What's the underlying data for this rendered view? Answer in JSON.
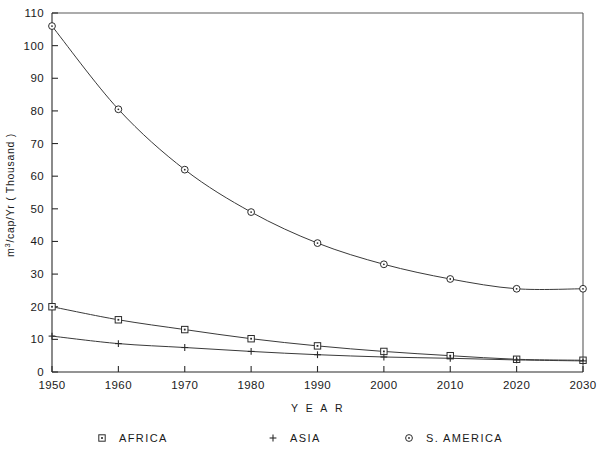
{
  "chart_data": {
    "type": "line",
    "title": "",
    "xlabel": "Y E A R",
    "ylabel": "m³/cap/Yr ( Thousand )",
    "x": [
      1950,
      1960,
      1970,
      1980,
      1990,
      2000,
      2010,
      2020,
      2030
    ],
    "xtick_labels": [
      "1950",
      "1960",
      "1970",
      "1980",
      "1990",
      "2000",
      "2010",
      "2020",
      "2030"
    ],
    "ytick_labels": [
      "0",
      "10",
      "20",
      "30",
      "40",
      "50",
      "60",
      "70",
      "80",
      "90",
      "100",
      "110"
    ],
    "yticks": [
      0,
      10,
      20,
      30,
      40,
      50,
      60,
      70,
      80,
      90,
      100,
      110
    ],
    "xlim": [
      1950,
      2030
    ],
    "ylim": [
      0,
      110
    ],
    "grid": false,
    "legend_position": "bottom",
    "series": [
      {
        "name": "AFRICA",
        "marker": "square",
        "values": [
          20.0,
          16.0,
          13.0,
          10.2,
          8.0,
          6.3,
          5.0,
          3.9,
          3.6
        ]
      },
      {
        "name": "ASIA",
        "marker": "plus",
        "values": [
          11.0,
          8.7,
          7.5,
          6.3,
          5.3,
          4.6,
          4.2,
          3.7,
          3.4
        ]
      },
      {
        "name": "S. AMERICA",
        "marker": "circle",
        "values": [
          106.0,
          80.5,
          62.0,
          49.0,
          39.5,
          33.0,
          28.5,
          25.5,
          25.5
        ]
      }
    ]
  },
  "axes": {
    "x_title": "Y E A R",
    "y_title": "m³/cap/Yr ( Thousand )",
    "y_title_base": "m",
    "y_title_exp": "3",
    "y_title_rest": "/cap/Yr ( Thousand )"
  },
  "legend": {
    "entries": [
      {
        "label": "AFRICA",
        "marker": "square"
      },
      {
        "label": "ASIA",
        "marker": "plus"
      },
      {
        "label": "S. AMERICA",
        "marker": "circle"
      }
    ]
  },
  "colors": {
    "background": "#ffffff",
    "axis": "#2b2b2b",
    "frame": "#5a5a5a",
    "line": "#3a3a3a",
    "text": "#1a1a1a"
  }
}
